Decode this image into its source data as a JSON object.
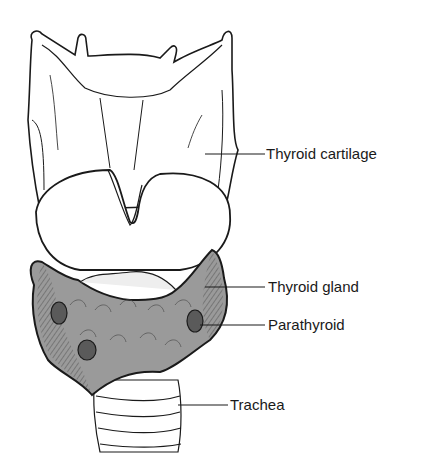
{
  "diagram": {
    "type": "anatomical illustration",
    "labels": [
      {
        "id": "thyroid-cartilage",
        "text": "Thyroid cartilage"
      },
      {
        "id": "thyroid-gland",
        "text": "Thyroid gland"
      },
      {
        "id": "parathyroid",
        "text": "Parathyroid"
      },
      {
        "id": "trachea",
        "text": "Trachea"
      }
    ],
    "colors": {
      "line": "#1a1a1a",
      "gland_fill": "#9a9a9a",
      "parathyroid_fill": "#5a5a5a",
      "background": "#ffffff"
    }
  }
}
